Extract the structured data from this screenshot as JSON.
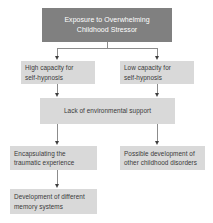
{
  "diagram": {
    "background_color": "#ffffff",
    "header_fill": "#808080",
    "node_fill": "#d9d9d9",
    "header_text_color": "#ffffff",
    "node_text_color": "#3a3a3a",
    "connector_color": "#8c8c8c",
    "arrowhead_color": "#3f3f3f",
    "nodes": [
      {
        "id": "stressor",
        "line1": "Exposure to Overwhelming",
        "line2": "Childhood Stressor"
      },
      {
        "id": "high-capacity",
        "line1": "High capacity for",
        "line2": "self-hypnosis"
      },
      {
        "id": "low-capacity",
        "line1": "Low capacity for",
        "line2": "self-hypnosis"
      },
      {
        "id": "lack-support",
        "line1": "Lack of environmental support",
        "line2": ""
      },
      {
        "id": "encapsulating",
        "line1": "Encapsulating the",
        "line2": "traumatic experience"
      },
      {
        "id": "possible-development",
        "line1": "Possible development of",
        "line2": "other childhood disorders"
      },
      {
        "id": "memory-systems",
        "line1": "Development of different",
        "line2": "memory systems"
      }
    ]
  }
}
